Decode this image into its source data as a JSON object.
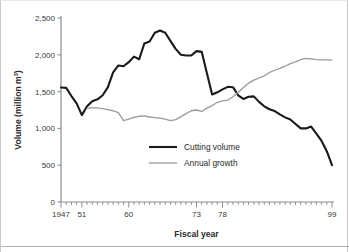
{
  "chart_data": {
    "type": "line",
    "title": "",
    "xlabel": "Fiscal year",
    "ylabel": "Volume (million m3)",
    "ylabel_base": "Volume (million m",
    "ylabel_sup": "3",
    "ylabel_tail": ")",
    "grid": false,
    "legend_position": "inside-center-lower",
    "xlim": [
      1947,
      1999
    ],
    "ylim": [
      0,
      2500
    ],
    "yticks": [
      0,
      500,
      1000,
      1500,
      2000,
      2500
    ],
    "ytick_labels": [
      "0",
      "500",
      "1,000",
      "1,500",
      "2,000",
      "2,500"
    ],
    "xtick_labeled": [
      1947,
      1951,
      1960,
      1973,
      1978,
      1999
    ],
    "xtick_labels": [
      "1947",
      "51",
      "60",
      "73",
      "78",
      "99"
    ],
    "xtick_step": 1,
    "x": [
      1947,
      1948,
      1949,
      1950,
      1951,
      1952,
      1953,
      1954,
      1955,
      1956,
      1957,
      1958,
      1959,
      1960,
      1961,
      1962,
      1963,
      1964,
      1965,
      1966,
      1967,
      1968,
      1969,
      1970,
      1971,
      1972,
      1973,
      1974,
      1975,
      1976,
      1977,
      1978,
      1979,
      1980,
      1981,
      1982,
      1983,
      1984,
      1985,
      1986,
      1987,
      1988,
      1989,
      1990,
      1991,
      1992,
      1993,
      1994,
      1995,
      1996,
      1997,
      1998,
      1999
    ],
    "series": [
      {
        "name": "Cutting volume",
        "color": "#1a1a1a",
        "width": 2.1,
        "values": [
          1555,
          1550,
          1440,
          1340,
          1180,
          1300,
          1370,
          1395,
          1450,
          1560,
          1760,
          1855,
          1845,
          1900,
          1975,
          1940,
          2155,
          2180,
          2300,
          2330,
          2300,
          2190,
          2080,
          2000,
          1990,
          1990,
          2050,
          2040,
          1750,
          1460,
          1490,
          1530,
          1565,
          1560,
          1450,
          1400,
          1430,
          1435,
          1360,
          1300,
          1260,
          1235,
          1190,
          1150,
          1120,
          1060,
          1000,
          1000,
          1025,
          930,
          830,
          690,
          500
        ]
      },
      {
        "name": "Annual growth",
        "color": "#9a9a9a",
        "width": 1.3,
        "values": [
          null,
          null,
          null,
          null,
          null,
          1275,
          1280,
          1278,
          1270,
          1255,
          1240,
          1215,
          1105,
          1125,
          1150,
          1165,
          1170,
          1155,
          1145,
          1140,
          1125,
          1105,
          1120,
          1160,
          1200,
          1240,
          1250,
          1230,
          1275,
          1310,
          1355,
          1375,
          1385,
          1430,
          1490,
          1555,
          1615,
          1655,
          1685,
          1715,
          1760,
          1790,
          1815,
          1845,
          1880,
          1905,
          1935,
          1950,
          1945,
          1935,
          1930,
          1930,
          1928
        ]
      }
    ],
    "legend_entries": [
      {
        "label": "Cutting volume",
        "color": "#1a1a1a",
        "width": 2.1
      },
      {
        "label": "Annual growth",
        "color": "#9a9a9a",
        "width": 1.3
      }
    ]
  }
}
